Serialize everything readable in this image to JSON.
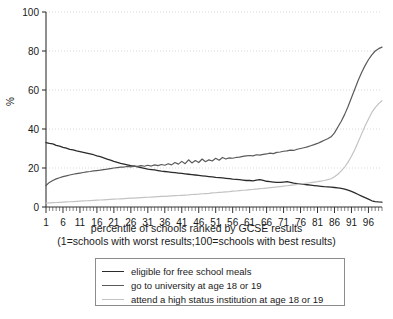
{
  "chart_data": {
    "type": "line",
    "title": "",
    "xlabel": "percentile of schools ranked by GCSE results",
    "xlabel_note": "(1=schools with worst results;100=schools with best results)",
    "ylabel": "%",
    "xlim": [
      1,
      100
    ],
    "ylim": [
      0,
      100
    ],
    "yticks": [
      0,
      20,
      40,
      60,
      80,
      100
    ],
    "xticks": [
      1,
      6,
      11,
      16,
      21,
      26,
      31,
      36,
      41,
      46,
      51,
      56,
      61,
      66,
      71,
      76,
      81,
      86,
      91,
      96
    ],
    "grid": true,
    "legend_position": "bottom",
    "x": [
      1,
      2,
      3,
      4,
      5,
      6,
      7,
      8,
      9,
      10,
      11,
      12,
      13,
      14,
      15,
      16,
      17,
      18,
      19,
      20,
      21,
      22,
      23,
      24,
      25,
      26,
      27,
      28,
      29,
      30,
      31,
      32,
      33,
      34,
      35,
      36,
      37,
      38,
      39,
      40,
      41,
      42,
      43,
      44,
      45,
      46,
      47,
      48,
      49,
      50,
      51,
      52,
      53,
      54,
      55,
      56,
      57,
      58,
      59,
      60,
      61,
      62,
      63,
      64,
      65,
      66,
      67,
      68,
      69,
      70,
      71,
      72,
      73,
      74,
      75,
      76,
      77,
      78,
      79,
      80,
      81,
      82,
      83,
      84,
      85,
      86,
      87,
      88,
      89,
      90,
      91,
      92,
      93,
      94,
      95,
      96,
      97,
      98,
      99,
      100
    ],
    "series": [
      {
        "name": "eligible for free school meals",
        "color": "#2b2b2b",
        "width": 1.3,
        "values": [
          33.0,
          32.6,
          32.4,
          31.6,
          31.2,
          30.6,
          30.2,
          29.6,
          29.3,
          28.8,
          28.4,
          28.0,
          27.6,
          27.2,
          26.8,
          26.2,
          25.8,
          25.2,
          24.6,
          24.0,
          23.4,
          22.9,
          22.4,
          22.0,
          21.6,
          21.2,
          21.0,
          20.6,
          20.2,
          19.8,
          19.4,
          19.2,
          19.0,
          18.7,
          18.4,
          18.2,
          18.0,
          17.8,
          17.6,
          17.4,
          17.2,
          17.0,
          16.8,
          16.6,
          16.4,
          16.2,
          16.0,
          15.8,
          15.6,
          15.4,
          15.2,
          15.1,
          14.9,
          14.7,
          14.5,
          14.3,
          14.2,
          14.0,
          13.8,
          13.6,
          13.6,
          13.4,
          13.8,
          14.0,
          13.6,
          13.2,
          13.0,
          12.8,
          12.6,
          12.6,
          12.8,
          13.0,
          12.6,
          12.2,
          12.0,
          11.8,
          11.6,
          11.4,
          11.2,
          11.0,
          10.8,
          10.6,
          10.4,
          10.3,
          10.2,
          10.0,
          9.8,
          9.6,
          9.2,
          8.6,
          8.0,
          7.2,
          6.4,
          5.6,
          4.8,
          4.0,
          3.2,
          2.8,
          2.6,
          2.5
        ]
      },
      {
        "name": "go to university at age 18 or 19",
        "color": "#5a5a5a",
        "width": 1.2,
        "values": [
          11.0,
          12.6,
          13.6,
          14.4,
          15.0,
          15.6,
          16.0,
          16.4,
          16.8,
          17.1,
          17.4,
          17.7,
          18.0,
          18.2,
          18.5,
          18.7,
          18.9,
          19.2,
          19.4,
          19.7,
          20.0,
          20.2,
          20.4,
          20.5,
          20.8,
          20.6,
          21.0,
          20.8,
          21.2,
          20.9,
          21.4,
          21.0,
          21.6,
          21.2,
          21.8,
          21.4,
          22.2,
          21.6,
          22.8,
          22.0,
          23.4,
          22.2,
          24.2,
          22.6,
          23.8,
          22.8,
          24.6,
          23.2,
          24.2,
          23.6,
          25.0,
          24.0,
          25.4,
          24.6,
          25.2,
          25.0,
          25.4,
          25.6,
          26.0,
          26.2,
          26.4,
          26.2,
          26.8,
          26.6,
          27.0,
          27.2,
          27.6,
          27.4,
          28.0,
          28.2,
          28.6,
          28.8,
          29.2,
          29.0,
          29.6,
          30.0,
          30.4,
          30.8,
          31.4,
          32.0,
          32.6,
          33.4,
          34.2,
          35.0,
          36.0,
          38.0,
          41.0,
          44.0,
          47.5,
          51.5,
          56.0,
          60.5,
          65.0,
          69.0,
          72.5,
          75.5,
          78.0,
          80.0,
          81.2,
          82.0
        ]
      },
      {
        "name": "attend a high status institution at age 18 or 19",
        "color": "#c3c3c3",
        "width": 1.2,
        "values": [
          2.0,
          2.1,
          2.2,
          2.3,
          2.4,
          2.5,
          2.6,
          2.7,
          2.8,
          2.9,
          3.0,
          3.1,
          3.2,
          3.3,
          3.4,
          3.5,
          3.6,
          3.7,
          3.8,
          3.9,
          4.0,
          4.1,
          4.2,
          4.3,
          4.4,
          4.5,
          4.6,
          4.7,
          4.8,
          4.9,
          5.0,
          5.1,
          5.2,
          5.3,
          5.4,
          5.5,
          5.6,
          5.7,
          5.8,
          5.9,
          6.0,
          6.1,
          6.2,
          6.4,
          6.5,
          6.6,
          6.8,
          6.9,
          7.0,
          7.2,
          7.3,
          7.5,
          7.6,
          7.8,
          7.9,
          8.1,
          8.2,
          8.4,
          8.6,
          8.7,
          8.9,
          9.0,
          9.2,
          9.4,
          9.5,
          9.7,
          9.9,
          10.1,
          10.3,
          10.5,
          10.7,
          10.9,
          11.1,
          11.3,
          11.6,
          11.8,
          12.0,
          12.3,
          12.5,
          12.8,
          13.0,
          13.3,
          13.6,
          14.0,
          14.5,
          15.5,
          16.8,
          18.5,
          20.5,
          23.0,
          26.0,
          29.5,
          33.5,
          37.5,
          41.5,
          45.0,
          48.5,
          51.0,
          53.0,
          54.5
        ]
      }
    ]
  }
}
